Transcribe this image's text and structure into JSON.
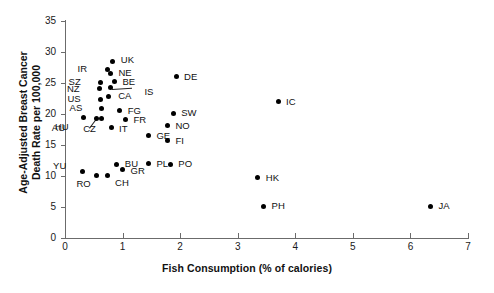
{
  "chart_data": {
    "type": "scatter",
    "title": "",
    "xlabel": "Fish Consumption (% of calories)",
    "ylabel_line1": "Age-Adjusted Breast Cancer",
    "ylabel_line2": "Death Rate per 100,000",
    "xlim": [
      0,
      7
    ],
    "ylim": [
      0,
      35
    ],
    "xticks": [
      0,
      1,
      2,
      3,
      4,
      5,
      6,
      7
    ],
    "yticks": [
      0,
      5,
      10,
      15,
      20,
      25,
      30,
      35
    ],
    "grid": false,
    "legend": "none",
    "marker": "filled-circle-black",
    "points": [
      {
        "label": "UK",
        "x": 0.83,
        "y": 28.5,
        "lx": 8,
        "ly": -6
      },
      {
        "label": "IR",
        "x": 0.73,
        "y": 27.2,
        "lx": -20,
        "ly": -5
      },
      {
        "label": "NE",
        "x": 0.79,
        "y": 26.6,
        "lx": 8,
        "ly": -5
      },
      {
        "label": "BE",
        "x": 0.86,
        "y": 25.2,
        "lx": 8,
        "ly": -5
      },
      {
        "label": "SZ",
        "x": 0.62,
        "y": 25.1,
        "lx": -20,
        "ly": -5
      },
      {
        "label": "NZ",
        "x": 0.6,
        "y": 24.1,
        "lx": -20,
        "ly": -5
      },
      {
        "label": "IS",
        "x": 0.79,
        "y": 24.2,
        "lx": 34,
        "ly": -1
      },
      {
        "label": "CA",
        "x": 0.75,
        "y": 22.9,
        "lx": 10,
        "ly": -5
      },
      {
        "label": "US",
        "x": 0.62,
        "y": 22.4,
        "lx": -20,
        "ly": -5
      },
      {
        "label": "AS",
        "x": 0.63,
        "y": 20.9,
        "lx": -19,
        "ly": -5
      },
      {
        "label": "FG",
        "x": 0.95,
        "y": 20.5,
        "lx": 8,
        "ly": -5
      },
      {
        "label": "FR",
        "x": 1.05,
        "y": 19.1,
        "lx": 8,
        "ly": -5
      },
      {
        "label": "HU",
        "x": 0.55,
        "y": 19.3,
        "lx": -28,
        "ly": 4
      },
      {
        "label": "IT",
        "x": 0.8,
        "y": 17.8,
        "lx": 8,
        "ly": -4
      },
      {
        "label": "AU",
        "x": 0.33,
        "y": 19.4,
        "lx": -19,
        "ly": 5
      },
      {
        "label": "CZ",
        "x": 0.64,
        "y": 19.3,
        "lx": -6,
        "ly": 6
      },
      {
        "label": "GE",
        "x": 1.45,
        "y": 16.5,
        "lx": 8,
        "ly": -5
      },
      {
        "label": "YU",
        "x": 0.3,
        "y": 10.8,
        "lx": -16,
        "ly": -10
      },
      {
        "label": "BU",
        "x": 0.9,
        "y": 11.9,
        "lx": 8,
        "ly": -5
      },
      {
        "label": "GR",
        "x": 1.0,
        "y": 11.0,
        "lx": 8,
        "ly": -4
      },
      {
        "label": "RO",
        "x": 0.55,
        "y": 10.1,
        "lx": -6,
        "ly": 4
      },
      {
        "label": "CH",
        "x": 0.73,
        "y": 10.1,
        "lx": 8,
        "ly": 3
      },
      {
        "label": "PL",
        "x": 1.45,
        "y": 12.0,
        "lx": 8,
        "ly": -5
      },
      {
        "label": "PO",
        "x": 1.83,
        "y": 11.9,
        "lx": 8,
        "ly": -5
      },
      {
        "label": "NO",
        "x": 1.78,
        "y": 18.1,
        "lx": 8,
        "ly": -5
      },
      {
        "label": "FI",
        "x": 1.78,
        "y": 15.7,
        "lx": 8,
        "ly": -5
      },
      {
        "label": "DE",
        "x": 1.93,
        "y": 26.0,
        "lx": 8,
        "ly": -5
      },
      {
        "label": "SW",
        "x": 1.88,
        "y": 20.1,
        "lx": 8,
        "ly": -5
      },
      {
        "label": "IC",
        "x": 3.7,
        "y": 22.0,
        "lx": 8,
        "ly": -5
      },
      {
        "label": "HK",
        "x": 3.35,
        "y": 9.7,
        "lx": 8,
        "ly": -5
      },
      {
        "label": "PH",
        "x": 3.45,
        "y": 5.1,
        "lx": 8,
        "ly": -5
      },
      {
        "label": "JA",
        "x": 6.35,
        "y": 5.1,
        "lx": 8,
        "ly": -5
      }
    ],
    "leaders": [
      {
        "from_label": "IS",
        "x1": 0.82,
        "y1": 24.1,
        "x2": 1.17,
        "y2": 24.3
      },
      {
        "from_label": "HU",
        "x1": 0.56,
        "y1": 19.2,
        "x2": 0.44,
        "y2": 17.7
      }
    ]
  },
  "axes": {
    "x_tick_labels": [
      "0",
      "1",
      "2",
      "3",
      "4",
      "5",
      "6",
      "7"
    ],
    "y_tick_labels": [
      "0",
      "5",
      "10",
      "15",
      "20",
      "25",
      "30",
      "35"
    ]
  }
}
